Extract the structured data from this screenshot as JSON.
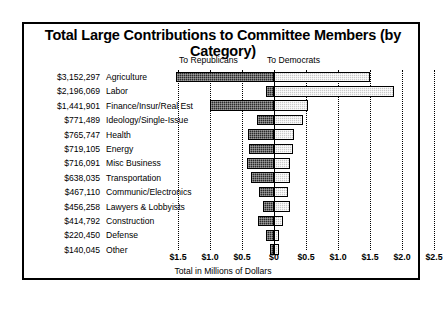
{
  "chart_data": {
    "type": "bar",
    "title": "Total Large Contributions to Committee Members (by Category)",
    "xlabel": "Total in Millions of Dollars",
    "ylabel": "",
    "orientation": "horizontal-diverging",
    "grid": true,
    "legend_position": "top",
    "axis_ticks": [
      "$1.5",
      "$1.0",
      "$0.5",
      "$0",
      "$0.5",
      "$1.0",
      "$1.5",
      "$2.0",
      "$2.5"
    ],
    "axis_tick_values": [
      -1.5,
      -1.0,
      -0.5,
      0,
      0.5,
      1.0,
      1.5,
      2.0,
      2.5
    ],
    "xlim": [
      -1.75,
      2.75
    ],
    "units": "millions of dollars",
    "legend": [
      {
        "name": "To Republicans",
        "side": "left",
        "color": "#2b2b2b"
      },
      {
        "name": "To Democrats",
        "side": "right",
        "color": "#c9c9c9"
      }
    ],
    "categories": [
      "Agriculture",
      "Labor",
      "Finance/Insur/Real Est",
      "Ideology/Single-Issue",
      "Health",
      "Energy",
      "Misc Business",
      "Transportation",
      "Communic/Electronics",
      "Lawyers & Lobbyists",
      "Construction",
      "Defense",
      "Other"
    ],
    "totals_label": [
      "$3,152,297",
      "$2,196,069",
      "$1,441,901",
      "$771,489",
      "$765,747",
      "$719,105",
      "$716,091",
      "$638,035",
      "$467,110",
      "$456,258",
      "$414,792",
      "$220,450",
      "$140,045"
    ],
    "totals": [
      3152297,
      2196069,
      1441901,
      771489,
      765747,
      719105,
      716091,
      638035,
      467110,
      456258,
      414792,
      220450,
      140045
    ],
    "series": [
      {
        "name": "To Republicans",
        "color": "#2b2b2b",
        "values": [
          1.53,
          0.13,
          1.0,
          0.27,
          0.41,
          0.39,
          0.42,
          0.36,
          0.23,
          0.17,
          0.25,
          0.13,
          0.06
        ]
      },
      {
        "name": "To Democrats",
        "color": "#c9c9c9",
        "values": [
          1.5,
          1.88,
          0.53,
          0.45,
          0.31,
          0.3,
          0.25,
          0.25,
          0.22,
          0.25,
          0.14,
          0.08,
          0.08
        ]
      }
    ]
  }
}
